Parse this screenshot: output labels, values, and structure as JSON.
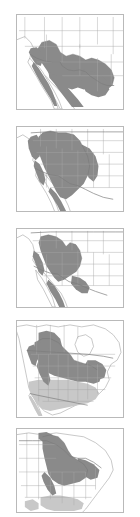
{
  "figure": {
    "panel_count": 5,
    "background_color": "#ffffff",
    "frame_color": "#b9b9b9",
    "coastline_color": "#9a9a9a",
    "admin_border_color": "#a8a8a8",
    "international_border_color": "#7d7d7d"
  },
  "legend": {
    "dark_fill_label": "Breeding / resident range",
    "dark_fill_color": "#8a8a8a",
    "light_fill_label": "Winter range",
    "light_fill_color": "#c8c8c8"
  },
  "panels": [
    {
      "index": 1,
      "name": "panel-southwest-mexico",
      "extent_label": "Southwestern United States and northern Mexico",
      "shading_levels": [
        "dark"
      ],
      "regions_shaded": "Southern California, Baja California, Arizona, southern Nevada, New Mexico, west Texas, Sonora, Chihuahua, Coahuila",
      "x": 16,
      "y": 14,
      "width": 108,
      "height": 96
    },
    {
      "index": 2,
      "name": "panel-western-interior",
      "extent_label": "Western United States interior",
      "shading_levels": [
        "dark"
      ],
      "regions_shaded": "Pacific Northwest, Great Basin, Rocky Mountains, Great Plains margin, Colorado Plateau, northern Mexico highlands",
      "x": 16,
      "y": 126,
      "width": 108,
      "height": 86
    },
    {
      "index": 3,
      "name": "panel-great-basin-southwest",
      "extent_label": "Great Basin and Southwest",
      "shading_levels": [
        "dark"
      ],
      "regions_shaded": "Oregon, Idaho, Nevada, Utah, Arizona, New Mexico, Wyoming, western Colorado, Sierra Madre Occidental, Gulf coastal plain",
      "x": 16,
      "y": 228,
      "width": 108,
      "height": 80
    },
    {
      "index": 4,
      "name": "panel-north-america-migratory",
      "extent_label": "North America, breeding and wintering",
      "shading_levels": [
        "dark",
        "light"
      ],
      "regions_shaded": "Dark: western Canada, Rocky Mountains, Great Lakes, Northeast. Light: southern United States, Gulf states, Mexico",
      "x": 16,
      "y": 320,
      "width": 108,
      "height": 98
    },
    {
      "index": 5,
      "name": "panel-great-lakes-northeast",
      "extent_label": "Great Lakes and Northeast",
      "shading_levels": [
        "dark",
        "light"
      ],
      "regions_shaded": "Dark: Manitoba, Minnesota, Wisconsin, Michigan, Ontario, Illinois, Indiana, Ohio. Light: southeastern United States",
      "x": 16,
      "y": 428,
      "width": 108,
      "height": 85
    }
  ]
}
